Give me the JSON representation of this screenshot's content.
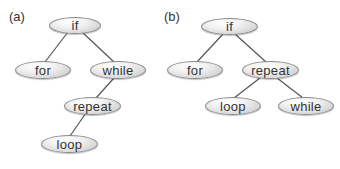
{
  "diagram": {
    "type": "tree-comparison",
    "colors": {
      "node_fill_light": "#ffffff",
      "node_fill_dark": "#bdbdbd",
      "node_border": "#8a8a8a",
      "edge": "#555555",
      "text": "#333333"
    },
    "panels": [
      {
        "label": "(a)",
        "nodes": [
          {
            "id": "a_if",
            "label": "if"
          },
          {
            "id": "a_for",
            "label": "for"
          },
          {
            "id": "a_while",
            "label": "while"
          },
          {
            "id": "a_repeat",
            "label": "repeat"
          },
          {
            "id": "a_loop",
            "label": "loop"
          }
        ],
        "edges": [
          {
            "from": "if",
            "to": "for"
          },
          {
            "from": "if",
            "to": "while"
          },
          {
            "from": "while",
            "to": "repeat"
          },
          {
            "from": "repeat",
            "to": "loop"
          }
        ]
      },
      {
        "label": "(b)",
        "nodes": [
          {
            "id": "b_if",
            "label": "if"
          },
          {
            "id": "b_for",
            "label": "for"
          },
          {
            "id": "b_repeat",
            "label": "repeat"
          },
          {
            "id": "b_loop",
            "label": "loop"
          },
          {
            "id": "b_while",
            "label": "while"
          }
        ],
        "edges": [
          {
            "from": "if",
            "to": "for"
          },
          {
            "from": "if",
            "to": "repeat"
          },
          {
            "from": "repeat",
            "to": "loop"
          },
          {
            "from": "repeat",
            "to": "while"
          }
        ]
      }
    ]
  }
}
